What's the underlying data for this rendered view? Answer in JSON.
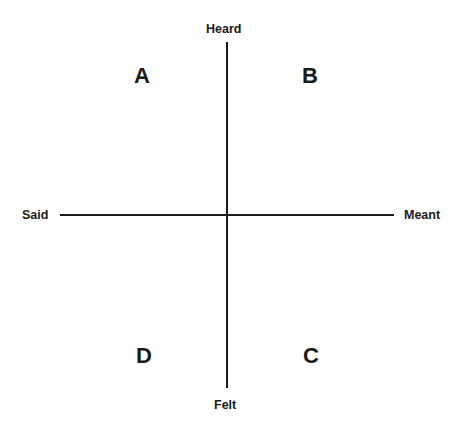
{
  "diagram": {
    "type": "quadrant",
    "axes": {
      "top": "Heard",
      "bottom": "Felt",
      "left": "Said",
      "right": "Meant"
    },
    "quadrants": {
      "top_left": "A",
      "top_right": "B",
      "bottom_right": "C",
      "bottom_left": "D"
    },
    "colors": {
      "line": "#1a1a1a",
      "text": "#1a1a1a",
      "background": "#ffffff"
    }
  }
}
